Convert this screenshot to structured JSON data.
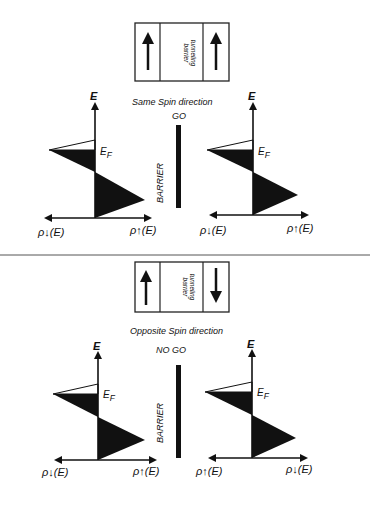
{
  "top": {
    "box": {
      "label_line1": "tunneling",
      "label_line2": "barrier",
      "left_arrow": "up",
      "right_arrow": "up"
    },
    "caption": "Same Spin direction",
    "status": "GO",
    "barrier_label": "BARRIER",
    "left_plot": {
      "axis_label": "E",
      "fermi_label": "EF",
      "x_left_label": "ρ↓(E)",
      "x_right_label": "ρ↑(E)"
    },
    "right_plot": {
      "axis_label": "E",
      "fermi_label": "EF",
      "x_left_label": "ρ↓(E)",
      "x_right_label": "ρ↑(E)"
    }
  },
  "bottom": {
    "box": {
      "label_line1": "tunneling",
      "label_line2": "barrier",
      "left_arrow": "up",
      "right_arrow": "down"
    },
    "caption": "Opposite Spin  direction",
    "status": "NO GO",
    "barrier_label": "BARRIER",
    "left_plot": {
      "axis_label": "E",
      "fermi_label": "EF",
      "x_left_label": "ρ↓(E)",
      "x_right_label": "ρ↑(E)"
    },
    "right_plot": {
      "axis_label": "E",
      "fermi_label": "EF",
      "x_left_label": "ρ↑(E)",
      "x_right_label": "ρ↓(E)"
    }
  },
  "labels": {
    "E": "E",
    "E_main": "E",
    "F_sub": "F",
    "rho": "ρ",
    "E_paren": "(E)"
  }
}
